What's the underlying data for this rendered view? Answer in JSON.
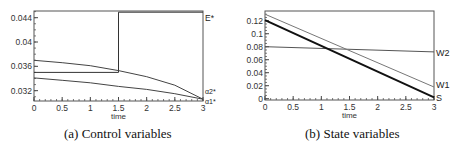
{
  "chart_data": [
    {
      "type": "line",
      "title": "",
      "caption": "(a) Control variables",
      "xlabel": "time",
      "ylabel": "",
      "xlim": [
        0,
        3
      ],
      "ylim": [
        0.0303,
        0.0451
      ],
      "x_ticks": [
        "0",
        "0.5",
        "1",
        "1.5",
        "2",
        "2.5",
        "3"
      ],
      "y_ticks": [
        "0.032",
        "0.036",
        "0.04",
        "0.044"
      ],
      "grid": false,
      "series": [
        {
          "name": "E*",
          "label": "E*",
          "x": [
            0,
            1.5,
            1.5,
            3
          ],
          "y": [
            0.035,
            0.035,
            0.0449,
            0.0449
          ]
        },
        {
          "name": "α2*",
          "label": "α2*",
          "x": [
            0,
            0.5,
            1,
            1.5,
            2,
            2.5,
            3
          ],
          "y": [
            0.037,
            0.0366,
            0.0361,
            0.0353,
            0.0343,
            0.0329,
            0.0306
          ]
        },
        {
          "name": "α1*",
          "label": "α1*",
          "x": [
            0,
            0.5,
            1,
            1.5,
            2,
            2.5,
            3
          ],
          "y": [
            0.0341,
            0.0337,
            0.0333,
            0.0327,
            0.0322,
            0.0315,
            0.0306
          ]
        }
      ]
    },
    {
      "type": "line",
      "title": "",
      "caption": "(b) State variables",
      "xlabel": "time",
      "ylabel": "",
      "xlim": [
        0,
        3
      ],
      "ylim": [
        -0.002,
        0.135
      ],
      "x_ticks": [
        "0",
        "0.5",
        "1",
        "1.5",
        "2",
        "2.5",
        "3"
      ],
      "y_ticks": [
        "0",
        "0.02",
        "0.04",
        "0.06",
        "0.08",
        "0.1",
        "0.12"
      ],
      "grid": false,
      "series": [
        {
          "name": "W2",
          "label": "W2",
          "x": [
            0,
            3
          ],
          "y": [
            0.08,
            0.072
          ]
        },
        {
          "name": "W1",
          "label": "W1",
          "x": [
            0,
            3
          ],
          "y": [
            0.13,
            0.018
          ]
        },
        {
          "name": "S",
          "label": "S",
          "x": [
            0,
            3
          ],
          "y": [
            0.121,
            0.002
          ]
        }
      ]
    }
  ]
}
